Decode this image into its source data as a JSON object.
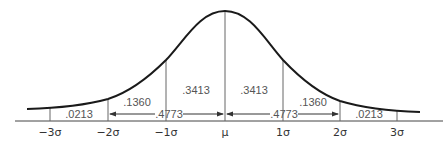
{
  "diagram": {
    "axis_labels": [
      "−3σ",
      "−2σ",
      "−1σ",
      "μ",
      "1σ",
      "2σ",
      "3σ"
    ],
    "area_labels": {
      "left_tail": ".0213",
      "left_mid": ".1360",
      "left_center": ".3413",
      "right_center": ".3413",
      "right_mid": ".1360",
      "right_tail": ".0213"
    },
    "span_labels": {
      "left_two_sigma": ".4773",
      "right_two_sigma": ".4773"
    },
    "colors": {
      "curve": "#1a1a1a",
      "lines": "#666666",
      "text": "#555555"
    }
  }
}
